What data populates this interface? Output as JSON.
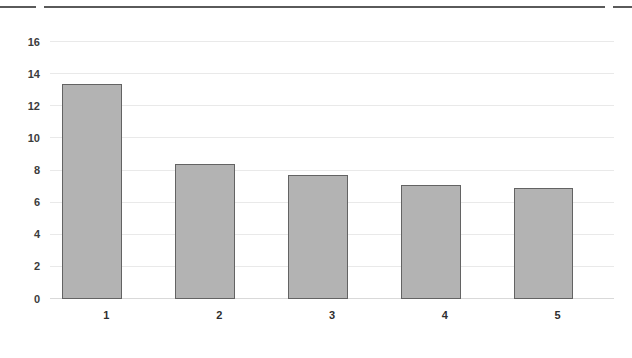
{
  "top_rule": {
    "color": "#5a5a5a",
    "segments": [
      "segment-left",
      "segment-center",
      "segment-right"
    ]
  },
  "chart_data": {
    "type": "bar",
    "title": "",
    "subtitle": "",
    "xlabel": "",
    "ylabel": "",
    "categories": [
      "1",
      "2",
      "3",
      "4",
      "5"
    ],
    "values": [
      13.4,
      8.4,
      7.7,
      7.1,
      6.9
    ],
    "ylim": [
      0,
      16
    ],
    "ytick_values": [
      0,
      2,
      4,
      6,
      8,
      10,
      12,
      14,
      16
    ],
    "ytick_labels": [
      "0",
      "2",
      "4",
      "6",
      "8",
      "10",
      "12",
      "14",
      "16"
    ],
    "grid": true,
    "grid_axis": "y",
    "legend": false,
    "legend_position": "none",
    "bar_fill_color": "#b3b3b3",
    "bar_edge_color": "#636363",
    "gridline_color": "#e9e9e9",
    "baseline_color": "#d9d9d9",
    "background_color": "#ffffff",
    "annotations": []
  }
}
